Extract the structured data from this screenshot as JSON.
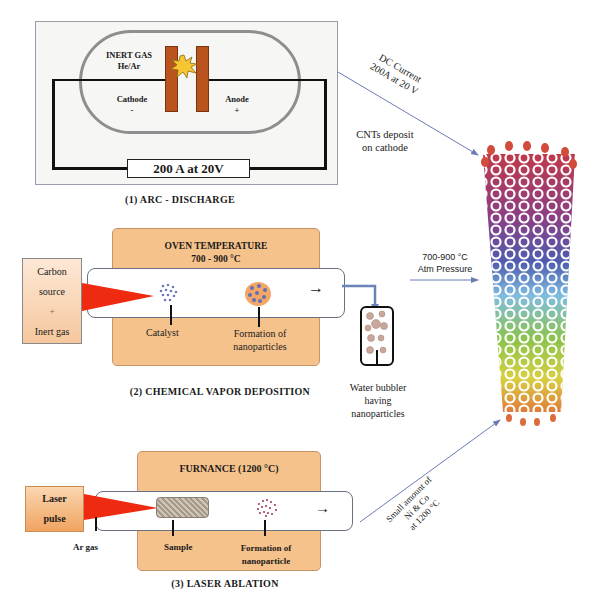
{
  "arc_discharge": {
    "gas_label_line1": "INERT GAS",
    "gas_label_line2": "He/Ar",
    "cathode_label": "Cathode",
    "cathode_sign": "-",
    "anode_label": "Anode",
    "anode_sign": "+",
    "power_label": "200 A at 20V",
    "caption": "(1) ARC - DISCHARGE",
    "arrow_label_line1": "DC Current",
    "arrow_label_line2": "200A at 20 V",
    "result_label_line1": "CNTs deposit",
    "result_label_line2": "on cathode"
  },
  "cvd": {
    "oven_title_line1": "OVEN TEMPERATURE",
    "oven_title_line2": "700 - 900 °C",
    "source_line1": "Carbon",
    "source_line2": "source",
    "source_line3": "+",
    "source_line4": "Inert gas",
    "catalyst_label": "Catalyst",
    "formation_label_line1": "Formation of",
    "formation_label_line2": "nanoparticles",
    "bubbler_label_line1": "Water bubbler",
    "bubbler_label_line2": "having",
    "bubbler_label_line3": "nanoparticles",
    "caption": "(2) CHEMICAL VAPOR DEPOSITION",
    "arrow_label_line1": "700-900 °C",
    "arrow_label_line2": "Atm Pressure",
    "flow_arrow": "→"
  },
  "laser_ablation": {
    "furnace_title": "FURNANCE (1200 °C)",
    "laser_line1": "Laser",
    "laser_line2": "pulse",
    "ar_gas_label": "Ar gas",
    "sample_label": "Sample",
    "formation_label_line1": "Formation of",
    "formation_label_line2": "nanoparticle",
    "caption": "(3) LASER ABLATION",
    "arrow_label_line1": "Small amount of",
    "arrow_label_line2": "Ni & Co",
    "arrow_label_line3": "at 1200 °C",
    "flow_arrow": "→"
  },
  "product": {
    "name": "carbon-nanotube",
    "colors": [
      "#c0394a",
      "#8a3f86",
      "#4e5db0",
      "#7fbde0",
      "#8bc34a",
      "#d8d040",
      "#e07b39"
    ]
  },
  "colors": {
    "oven": "#f6c28c",
    "electrode": "#b9541f",
    "flame": "#ee2a10",
    "arrow_line": "#6a7bb5"
  }
}
